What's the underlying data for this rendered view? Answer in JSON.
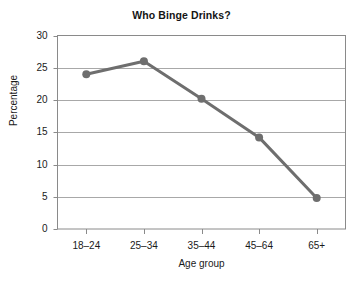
{
  "chart_data": {
    "type": "line",
    "title": "Who Binge Drinks?",
    "xlabel": "Age group",
    "ylabel": "Percentage",
    "categories": [
      "18–24",
      "25–34",
      "35–44",
      "45–64",
      "65+"
    ],
    "values": [
      24.0,
      26.0,
      20.2,
      14.2,
      4.8
    ],
    "series": [
      {
        "name": "Percentage",
        "values": [
          24.0,
          26.0,
          20.2,
          14.2,
          4.8
        ]
      }
    ],
    "ylim": [
      0,
      30
    ],
    "yticks": [
      0,
      5,
      10,
      15,
      20,
      25,
      30
    ],
    "ytick_labels": [
      "0",
      "5",
      "10",
      "15",
      "20",
      "25",
      "30"
    ],
    "grid": "horizontal",
    "legend": "none",
    "marker": "circle",
    "colors": {
      "line": "#6e6e6e",
      "marker": "#6e6e6e",
      "grid": "#a8a8a8",
      "axis": "#8a8a8a",
      "text": "#1a1a1a"
    }
  }
}
